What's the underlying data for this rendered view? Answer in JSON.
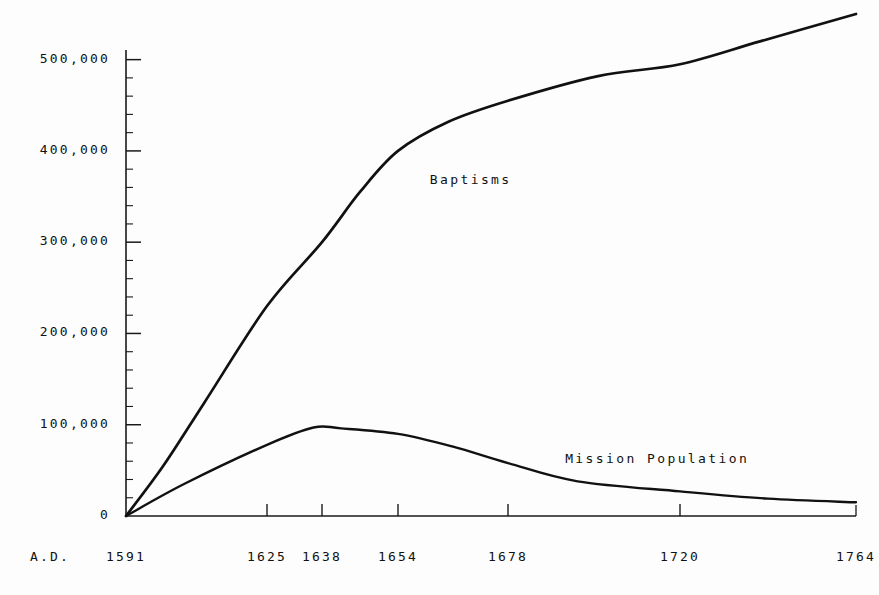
{
  "chart_data": {
    "type": "line",
    "title": "",
    "xlabel": "",
    "ylabel": "",
    "era_prefix": "A.D.",
    "x": [
      1591,
      1625,
      1638,
      1654,
      1678,
      1720,
      1764
    ],
    "xtick_labels": [
      "1591",
      "1625",
      "1638",
      "1654",
      "1678",
      "1720",
      "1764"
    ],
    "ytick_labels": [
      "0",
      "100,000",
      "200,000",
      "300,000",
      "400,000",
      "500,000"
    ],
    "ytick_values": [
      0,
      100000,
      200000,
      300000,
      400000,
      500000
    ],
    "ylim": [
      0,
      550000
    ],
    "xlim": [
      1591,
      1764
    ],
    "grid": false,
    "legend_position": "inline-annotations",
    "minor_ticks": true,
    "minor_tick_step": 20000,
    "series": [
      {
        "name": "Baptisms",
        "label_x": 1657,
        "label_y": 368000,
        "values": [
          0,
          230000,
          300000,
          400000,
          455000,
          495000,
          550000
        ],
        "points": [
          {
            "year": 1591,
            "value": 0
          },
          {
            "year": 1600,
            "value": 55000
          },
          {
            "year": 1610,
            "value": 125000
          },
          {
            "year": 1625,
            "value": 230000
          },
          {
            "year": 1638,
            "value": 300000
          },
          {
            "year": 1646,
            "value": 355000
          },
          {
            "year": 1654,
            "value": 400000
          },
          {
            "year": 1665,
            "value": 432000
          },
          {
            "year": 1678,
            "value": 455000
          },
          {
            "year": 1700,
            "value": 482000
          },
          {
            "year": 1720,
            "value": 495000
          },
          {
            "year": 1740,
            "value": 520000
          },
          {
            "year": 1764,
            "value": 550000
          }
        ]
      },
      {
        "name": "Mission Population",
        "label_x": 1690,
        "label_y": 62000,
        "values": [
          0,
          78000,
          97000,
          90000,
          58000,
          27000,
          15000
        ],
        "points": [
          {
            "year": 1591,
            "value": 0
          },
          {
            "year": 1605,
            "value": 35000
          },
          {
            "year": 1625,
            "value": 78000
          },
          {
            "year": 1636,
            "value": 97000
          },
          {
            "year": 1642,
            "value": 96000
          },
          {
            "year": 1654,
            "value": 90000
          },
          {
            "year": 1666,
            "value": 76000
          },
          {
            "year": 1678,
            "value": 58000
          },
          {
            "year": 1695,
            "value": 38000
          },
          {
            "year": 1720,
            "value": 27000
          },
          {
            "year": 1742,
            "value": 19000
          },
          {
            "year": 1764,
            "value": 15000
          }
        ]
      }
    ]
  },
  "style": {
    "axis_color": "#1a1a1a",
    "curve_color": "#111111",
    "background": "#fdfdfd",
    "text_color": "#111111"
  }
}
